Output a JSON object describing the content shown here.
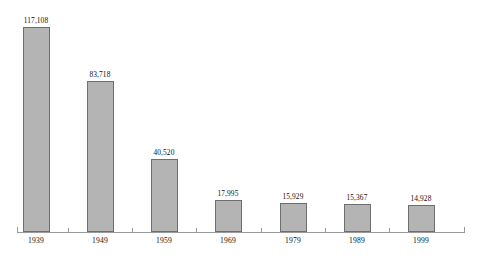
{
  "chart_data": {
    "type": "bar",
    "title": "",
    "subtitle": "",
    "xlabel": "",
    "ylabel": "",
    "categories": [
      "1939",
      "1949",
      "1959",
      "1969",
      "1979",
      "1989",
      "1999"
    ],
    "values": [
      117108,
      83718,
      40520,
      17995,
      15929,
      15367,
      14928
    ],
    "value_labels": [
      "117,108",
      "83,718",
      "40,520",
      "17,995",
      "15,929",
      "15,367",
      "14,928"
    ],
    "series": [
      {
        "name": "",
        "values": [
          117108,
          83718,
          40520,
          17995,
          15929,
          15367,
          14928
        ]
      }
    ],
    "ylim": [
      0,
      117108
    ],
    "grid": false,
    "legend": false,
    "legend_position": "none",
    "axis": {
      "x_axis_visible": true,
      "y_axis_visible": false,
      "x_tick_marks": true
    },
    "style": {
      "bar_fill": "#b4b4b4",
      "bar_border": "#6e6e6e",
      "axis_color": "#9a9a9a",
      "text_color": "#111111",
      "background": "#ffffff"
    }
  }
}
